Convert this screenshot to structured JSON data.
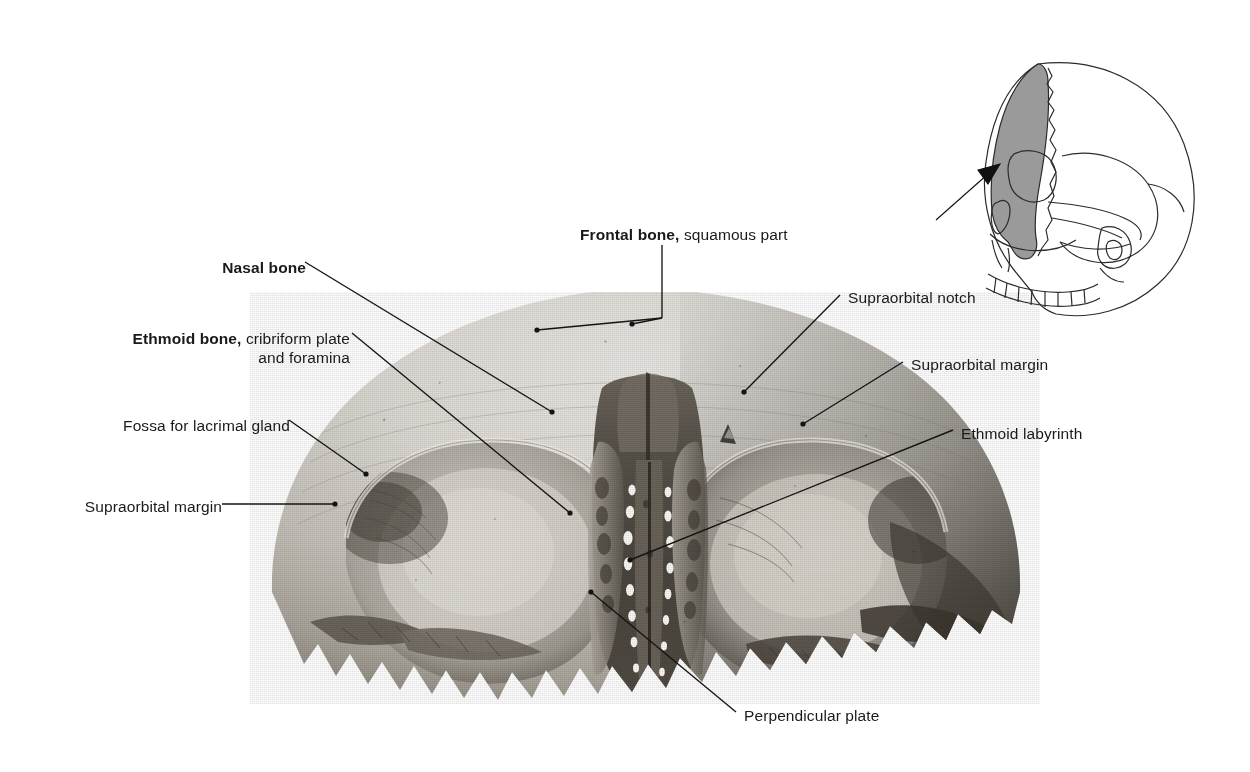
{
  "figure": {
    "background_color": "#ffffff",
    "label_color": "#1a1a1a",
    "leader_color": "#141414"
  },
  "labels": [
    {
      "id": "frontal-bone-squamous-part",
      "bold_text": "Frontal bone,",
      "plain_text": " squamous part",
      "x": 580,
      "y": 225,
      "align": "center"
    },
    {
      "id": "nasal-bone",
      "bold_text": "Nasal bone",
      "plain_text": "",
      "x": 196,
      "y": 258,
      "align": "right"
    },
    {
      "id": "ethmoid-bone-cribriform-plate",
      "bold_text": "Ethmoid bone,",
      "plain_text": " cribriform plate",
      "line2": "and foramina",
      "x": 78,
      "y": 329,
      "align": "right"
    },
    {
      "id": "fossa-for-lacrimal-gland",
      "bold_text": "",
      "plain_text": "Fossa for lacrimal gland",
      "x": 76,
      "y": 416,
      "align": "right"
    },
    {
      "id": "supraorbital-margin-left",
      "bold_text": "",
      "plain_text": "Supraorbital margin",
      "x": 62,
      "y": 497,
      "align": "right"
    },
    {
      "id": "supraorbital-notch",
      "bold_text": "",
      "plain_text": "Supraorbital notch",
      "x": 848,
      "y": 288,
      "align": "left"
    },
    {
      "id": "supraorbital-margin-right",
      "bold_text": "",
      "plain_text": "Supraorbital margin",
      "x": 911,
      "y": 355,
      "align": "left"
    },
    {
      "id": "ethmoid-labyrinth",
      "bold_text": "",
      "plain_text": "Ethmoid labyrinth",
      "x": 961,
      "y": 424,
      "align": "left"
    },
    {
      "id": "perpendicular-plate",
      "bold_text": "",
      "plain_text": "Perpendicular plate",
      "x": 744,
      "y": 706,
      "align": "left"
    }
  ],
  "orientation_diagram": {
    "id": "orientation-skull",
    "description": "Lateral view of skull with frontal bone shaded and arrow indicating viewing direction",
    "shaded_bone": "Frontal bone",
    "shade_color": "#9a9a9a",
    "outline_color": "#2b2b2b",
    "arrow_direction": "from lower-left toward the frontal bone"
  },
  "specimen": {
    "id": "frontal-bone-specimen",
    "description": "Photograph of the frontal bone seen from below (inferior view) with the ethmoid bone articulated in the ethmoidal notch",
    "parts": [
      "squamous part of frontal bone",
      "left orbital plate",
      "right orbital plate",
      "supraorbital margin",
      "supraorbital notch",
      "fossa for lacrimal gland",
      "ethmoid bone cribriform plate and foramina",
      "ethmoid labyrinth",
      "perpendicular plate",
      "nasal bone"
    ]
  }
}
